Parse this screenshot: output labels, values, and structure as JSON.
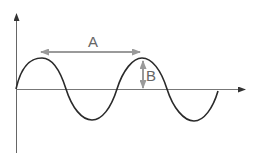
{
  "diagram": {
    "type": "sine-wave",
    "labels": {
      "wavelength": "A",
      "amplitude": "B"
    },
    "colors": {
      "wave": "#2a2a2a",
      "axes": "#555555",
      "annotation": "#999999",
      "label": "#666666"
    },
    "wave": {
      "periods": 2,
      "starts_at_origin": true
    }
  }
}
